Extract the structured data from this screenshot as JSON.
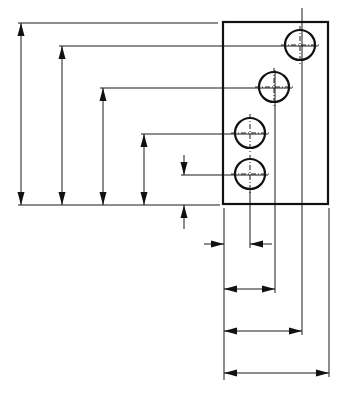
{
  "diagram": {
    "title": "",
    "type": "dimensioned-plate-drawing",
    "plate": {
      "x": 223,
      "y": 22,
      "width": 105,
      "height": 182
    },
    "holes": [
      {
        "cx": 300,
        "cy": 45,
        "r": 15
      },
      {
        "cx": 274,
        "cy": 87,
        "r": 15
      },
      {
        "cx": 250,
        "cy": 133,
        "r": 15
      },
      {
        "cx": 250,
        "cy": 174,
        "r": 15
      }
    ],
    "vertical_dimensions": [
      {
        "x": 21,
        "from_y": 23,
        "to_y": 205
      },
      {
        "x": 62,
        "from_y": 46,
        "to_y": 205
      },
      {
        "x": 103,
        "from_y": 88,
        "to_y": 205
      },
      {
        "x": 144,
        "from_y": 134,
        "to_y": 205
      },
      {
        "x": 184,
        "from_y": 175,
        "to_y": 205,
        "style": "outside-arrows"
      }
    ],
    "horizontal_dimensions": [
      {
        "y": 244,
        "from_x": 224,
        "to_x": 250,
        "style": "outside-arrows"
      },
      {
        "y": 289,
        "from_x": 224,
        "to_x": 275
      },
      {
        "y": 331,
        "from_x": 224,
        "to_x": 302
      },
      {
        "y": 373,
        "from_x": 224,
        "to_x": 329
      }
    ],
    "labels": []
  }
}
